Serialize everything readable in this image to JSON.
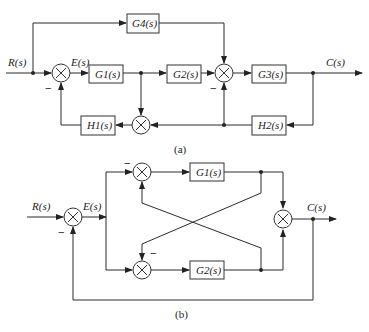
{
  "diagram_a": {
    "caption": "(a)",
    "input_label": "R(s)",
    "error_label": "E(s)",
    "output_label": "C(s)",
    "blocks": {
      "g1": "G1(s)",
      "g2": "G2(s)",
      "g3": "G3(s)",
      "g4": "G4(s)",
      "h1": "H1(s)",
      "h2": "H2(s)"
    },
    "signs": {
      "sum1_feedback": "−",
      "sum2_feedback": "−"
    }
  },
  "diagram_b": {
    "caption": "(b)",
    "input_label": "R(s)",
    "error_label": "E(s)",
    "output_label": "C(s)",
    "blocks": {
      "g1": "G1(s)",
      "g2": "G2(s)"
    },
    "signs": {
      "main_feedback": "−",
      "top_sum_input": "−",
      "bottom_sum_cross": "−"
    }
  },
  "colors": {
    "line": "#2b2b2b",
    "background": "#ffffff"
  }
}
